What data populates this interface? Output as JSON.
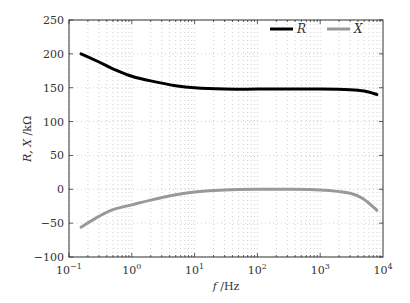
{
  "chart_data": {
    "type": "line",
    "title": "",
    "xlabel": "f /Hz",
    "ylabel": "R, X /kΩ",
    "xscale": "log",
    "xlim": [
      0.1,
      10000
    ],
    "ylim": [
      -100,
      250
    ],
    "grid": true,
    "grid_style": "dotted",
    "legend_position": "upper right",
    "x_tick_labels": [
      "10^-1",
      "10^0",
      "10^1",
      "10^2",
      "10^3",
      "10^4"
    ],
    "y_tick_labels": [
      "-100",
      "-50",
      "0",
      "50",
      "100",
      "150",
      "200",
      "250"
    ],
    "x": [
      0.155,
      0.3,
      0.5,
      1,
      2,
      5,
      10,
      30,
      100,
      300,
      1000,
      3000,
      5000,
      8000
    ],
    "series": [
      {
        "name": "R",
        "color": "#000000",
        "values": [
          200,
          188,
          178,
          167,
          160,
          153,
          150,
          148,
          148,
          148,
          148,
          147,
          145,
          140
        ]
      },
      {
        "name": "X",
        "color": "#999999",
        "values": [
          -56,
          -40,
          -30,
          -23,
          -16,
          -8,
          -4,
          -1,
          0,
          0,
          -1,
          -6,
          -15,
          -31
        ]
      }
    ]
  }
}
